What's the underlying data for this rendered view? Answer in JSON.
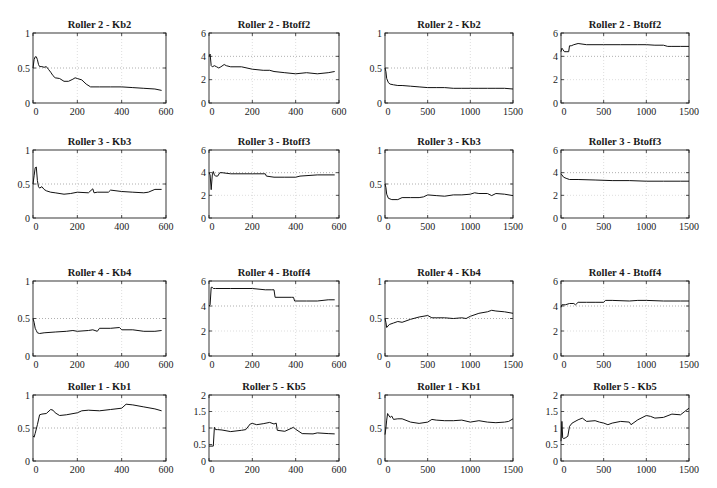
{
  "figure": {
    "layout": {
      "rows": 4,
      "cols": 4
    }
  },
  "chart_data": [
    {
      "id": "r2-kb2-600",
      "type": "line",
      "title": "Roller 2 - Kb2",
      "xlabel": "",
      "ylabel": "",
      "xlim": [
        0,
        600
      ],
      "ylim": [
        0,
        1
      ],
      "xticks": [
        "0",
        "200",
        "400",
        "600"
      ],
      "yticks": [
        "0",
        "0.5",
        "1"
      ],
      "ytick_values": [
        0,
        0.5,
        1
      ],
      "xtick_values": [
        0,
        200,
        400,
        600
      ],
      "grid": true,
      "refline": 0.5,
      "x": [
        0,
        5,
        10,
        15,
        20,
        25,
        30,
        40,
        50,
        60,
        70,
        80,
        90,
        100,
        120,
        140,
        160,
        180,
        190,
        200,
        220,
        240,
        260,
        300,
        350,
        400,
        450,
        500,
        550,
        580
      ],
      "values": [
        0.5,
        0.62,
        0.66,
        0.66,
        0.62,
        0.55,
        0.52,
        0.52,
        0.51,
        0.52,
        0.48,
        0.44,
        0.39,
        0.36,
        0.35,
        0.31,
        0.31,
        0.34,
        0.36,
        0.35,
        0.33,
        0.27,
        0.23,
        0.23,
        0.23,
        0.23,
        0.22,
        0.21,
        0.2,
        0.18
      ]
    },
    {
      "id": "r2-btoff2-600",
      "type": "line",
      "title": "Roller 2 - Btoff2",
      "xlabel": "",
      "ylabel": "",
      "xlim": [
        0,
        600
      ],
      "ylim": [
        0,
        6
      ],
      "xticks": [
        "0",
        "200",
        "400",
        "600"
      ],
      "yticks": [
        "0",
        "2",
        "4",
        "6"
      ],
      "ytick_values": [
        0,
        2,
        4,
        6
      ],
      "xtick_values": [
        0,
        200,
        400,
        600
      ],
      "grid": true,
      "refline": 4,
      "x": [
        0,
        5,
        10,
        15,
        25,
        35,
        45,
        55,
        70,
        80,
        100,
        150,
        200,
        250,
        280,
        300,
        350,
        400,
        450,
        500,
        550,
        580
      ],
      "values": [
        4.0,
        4.2,
        3.2,
        3.1,
        3.2,
        3.1,
        3.0,
        3.1,
        3.3,
        3.2,
        3.1,
        3.1,
        2.9,
        2.8,
        2.8,
        2.7,
        2.6,
        2.5,
        2.6,
        2.5,
        2.6,
        2.7
      ]
    },
    {
      "id": "r2-kb2-1500",
      "type": "line",
      "title": "Roller 2 - Kb2",
      "xlabel": "",
      "ylabel": "",
      "xlim": [
        0,
        1500
      ],
      "ylim": [
        0,
        1
      ],
      "xticks": [
        "0",
        "500",
        "1000",
        "1500"
      ],
      "yticks": [
        "0",
        "0.5",
        "1"
      ],
      "ytick_values": [
        0,
        0.5,
        1
      ],
      "xtick_values": [
        0,
        500,
        1000,
        1500
      ],
      "grid": true,
      "refline": 0.5,
      "x": [
        0,
        10,
        20,
        40,
        60,
        100,
        150,
        200,
        300,
        400,
        500,
        600,
        700,
        800,
        900,
        1000,
        1100,
        1200,
        1300,
        1400,
        1500
      ],
      "values": [
        0.5,
        0.45,
        0.35,
        0.29,
        0.27,
        0.26,
        0.25,
        0.25,
        0.24,
        0.23,
        0.22,
        0.22,
        0.22,
        0.21,
        0.21,
        0.21,
        0.21,
        0.21,
        0.21,
        0.21,
        0.2
      ]
    },
    {
      "id": "r2-btoff2-1500",
      "type": "line",
      "title": "Roller 2 - Btoff2",
      "xlabel": "",
      "ylabel": "",
      "xlim": [
        0,
        1500
      ],
      "ylim": [
        0,
        6
      ],
      "xticks": [
        "0",
        "500",
        "1000",
        "1500"
      ],
      "yticks": [
        "0",
        "2",
        "4",
        "6"
      ],
      "ytick_values": [
        0,
        2,
        4,
        6
      ],
      "xtick_values": [
        0,
        500,
        1000,
        1500
      ],
      "grid": true,
      "refline": 4,
      "x": [
        0,
        10,
        20,
        40,
        60,
        90,
        100,
        120,
        150,
        200,
        300,
        500,
        700,
        900,
        1000,
        1100,
        1200,
        1250,
        1300,
        1400,
        1500
      ],
      "values": [
        4.4,
        4.7,
        4.6,
        4.4,
        4.4,
        4.4,
        4.9,
        4.9,
        5.0,
        5.1,
        5.0,
        5.0,
        5.0,
        5.0,
        5.0,
        4.95,
        4.95,
        4.85,
        4.85,
        4.85,
        4.85
      ]
    },
    {
      "id": "r3-kb3-600",
      "type": "line",
      "title": "Roller 3 - Kb3",
      "xlabel": "",
      "ylabel": "",
      "xlim": [
        0,
        600
      ],
      "ylim": [
        0,
        1
      ],
      "xticks": [
        "0",
        "200",
        "400",
        "600"
      ],
      "yticks": [
        "0",
        "0.5",
        "1"
      ],
      "ytick_values": [
        0,
        0.5,
        1
      ],
      "xtick_values": [
        0,
        200,
        400,
        600
      ],
      "grid": true,
      "refline": 0.5,
      "x": [
        0,
        5,
        10,
        15,
        20,
        25,
        30,
        40,
        50,
        60,
        80,
        100,
        140,
        170,
        200,
        250,
        270,
        275,
        290,
        340,
        350,
        400,
        450,
        500,
        520,
        550,
        580
      ],
      "values": [
        0.5,
        0.62,
        0.74,
        0.75,
        0.55,
        0.46,
        0.44,
        0.46,
        0.42,
        0.4,
        0.38,
        0.37,
        0.35,
        0.36,
        0.38,
        0.37,
        0.43,
        0.37,
        0.38,
        0.38,
        0.41,
        0.39,
        0.38,
        0.37,
        0.38,
        0.42,
        0.42
      ]
    },
    {
      "id": "r3-btoff3-600",
      "type": "line",
      "title": "Roller 3 - Btoff3",
      "xlabel": "",
      "ylabel": "",
      "xlim": [
        0,
        600
      ],
      "ylim": [
        0,
        6
      ],
      "xticks": [
        "0",
        "200",
        "400",
        "600"
      ],
      "yticks": [
        "0",
        "2",
        "4",
        "6"
      ],
      "ytick_values": [
        0,
        2,
        4,
        6
      ],
      "xtick_values": [
        0,
        200,
        400,
        600
      ],
      "grid": true,
      "refline": 4,
      "x": [
        0,
        5,
        10,
        12,
        15,
        20,
        25,
        30,
        40,
        50,
        60,
        100,
        200,
        260,
        265,
        300,
        350,
        400,
        420,
        500,
        580
      ],
      "values": [
        4.0,
        3.8,
        2.5,
        3.0,
        3.8,
        4.1,
        3.8,
        3.7,
        3.7,
        4.0,
        4.0,
        3.9,
        3.9,
        3.9,
        3.7,
        3.6,
        3.6,
        3.6,
        3.7,
        3.8,
        3.8
      ]
    },
    {
      "id": "r3-kb3-1500",
      "type": "line",
      "title": "Roller 3 - Kb3",
      "xlabel": "",
      "ylabel": "",
      "xlim": [
        0,
        1500
      ],
      "ylim": [
        0,
        1
      ],
      "xticks": [
        "0",
        "500",
        "1000",
        "1500"
      ],
      "yticks": [
        "0",
        "0.5",
        "1"
      ],
      "ytick_values": [
        0,
        0.5,
        1
      ],
      "xtick_values": [
        0,
        500,
        1000,
        1500
      ],
      "grid": true,
      "refline": 0.5,
      "x": [
        0,
        10,
        20,
        40,
        80,
        150,
        200,
        300,
        400,
        450,
        500,
        600,
        700,
        800,
        900,
        1000,
        1050,
        1100,
        1200,
        1250,
        1300,
        1400,
        1500
      ],
      "values": [
        0.5,
        0.45,
        0.35,
        0.29,
        0.27,
        0.27,
        0.3,
        0.3,
        0.3,
        0.31,
        0.34,
        0.33,
        0.32,
        0.34,
        0.34,
        0.35,
        0.37,
        0.36,
        0.36,
        0.33,
        0.36,
        0.35,
        0.33
      ]
    },
    {
      "id": "r3-btoff3-1500",
      "type": "line",
      "title": "Roller 3 - Btoff3",
      "xlabel": "",
      "ylabel": "",
      "xlim": [
        0,
        1500
      ],
      "ylim": [
        0,
        6
      ],
      "xticks": [
        "0",
        "500",
        "1000",
        "1500"
      ],
      "yticks": [
        "0",
        "2",
        "4",
        "6"
      ],
      "ytick_values": [
        0,
        2,
        4,
        6
      ],
      "xtick_values": [
        0,
        500,
        1000,
        1500
      ],
      "grid": true,
      "refline": 4,
      "x": [
        0,
        10,
        30,
        60,
        100,
        200,
        400,
        600,
        800,
        1000,
        1200,
        1400,
        1500
      ],
      "values": [
        3.9,
        3.8,
        3.6,
        3.5,
        3.4,
        3.4,
        3.35,
        3.3,
        3.3,
        3.25,
        3.25,
        3.25,
        3.25
      ]
    },
    {
      "id": "r4-kb4-600",
      "type": "line",
      "title": "Roller 4 - Kb4",
      "xlabel": "",
      "ylabel": "",
      "xlim": [
        0,
        600
      ],
      "ylim": [
        0,
        1
      ],
      "xticks": [
        "0",
        "200",
        "400",
        "600"
      ],
      "yticks": [
        "0",
        "0.5",
        "1"
      ],
      "ytick_values": [
        0,
        0.5,
        1
      ],
      "xtick_values": [
        0,
        200,
        400,
        600
      ],
      "grid": true,
      "refline": 0.5,
      "x": [
        0,
        5,
        10,
        15,
        20,
        30,
        50,
        100,
        150,
        180,
        200,
        250,
        270,
        290,
        300,
        350,
        390,
        400,
        450,
        500,
        550,
        580
      ],
      "values": [
        0.5,
        0.45,
        0.37,
        0.34,
        0.31,
        0.3,
        0.31,
        0.32,
        0.33,
        0.34,
        0.33,
        0.34,
        0.35,
        0.33,
        0.37,
        0.37,
        0.38,
        0.35,
        0.35,
        0.33,
        0.33,
        0.34
      ]
    },
    {
      "id": "r4-btoff4-600",
      "type": "line",
      "title": "Roller 4 - Btoff4",
      "xlabel": "",
      "ylabel": "",
      "xlim": [
        0,
        600
      ],
      "ylim": [
        0,
        6
      ],
      "xticks": [
        "0",
        "200",
        "400",
        "600"
      ],
      "yticks": [
        "0",
        "2",
        "4",
        "6"
      ],
      "ytick_values": [
        0,
        2,
        4,
        6
      ],
      "xtick_values": [
        0,
        200,
        400,
        600
      ],
      "grid": true,
      "refline": 4,
      "x": [
        0,
        5,
        10,
        15,
        20,
        30,
        100,
        200,
        260,
        290,
        300,
        305,
        380,
        390,
        395,
        450,
        500,
        550,
        580
      ],
      "values": [
        4.0,
        4.1,
        5.5,
        5.5,
        5.4,
        5.4,
        5.4,
        5.4,
        5.3,
        5.3,
        5.3,
        4.7,
        4.7,
        4.7,
        4.4,
        4.4,
        4.4,
        4.5,
        4.5
      ]
    },
    {
      "id": "r4-kb4-1500",
      "type": "line",
      "title": "Roller 4 - Kb4",
      "xlabel": "",
      "ylabel": "",
      "xlim": [
        0,
        1500
      ],
      "ylim": [
        0,
        1
      ],
      "xticks": [
        "0",
        "500",
        "1000",
        "1500"
      ],
      "yticks": [
        "0",
        "0.5",
        "1"
      ],
      "ytick_values": [
        0,
        0.5,
        1
      ],
      "xtick_values": [
        0,
        500,
        1000,
        1500
      ],
      "grid": true,
      "refline": 0.5,
      "x": [
        0,
        10,
        20,
        50,
        100,
        150,
        200,
        300,
        400,
        500,
        550,
        600,
        700,
        800,
        900,
        950,
        1000,
        1100,
        1200,
        1250,
        1300,
        1400,
        1500
      ],
      "values": [
        0.5,
        0.45,
        0.38,
        0.42,
        0.44,
        0.46,
        0.45,
        0.49,
        0.52,
        0.54,
        0.51,
        0.51,
        0.51,
        0.5,
        0.51,
        0.5,
        0.53,
        0.57,
        0.59,
        0.61,
        0.6,
        0.59,
        0.57
      ]
    },
    {
      "id": "r4-btoff4-1500",
      "type": "line",
      "title": "Roller 4 - Btoff4",
      "xlabel": "",
      "ylabel": "",
      "xlim": [
        0,
        1500
      ],
      "ylim": [
        0,
        6
      ],
      "xticks": [
        "0",
        "500",
        "1000",
        "1500"
      ],
      "yticks": [
        "0",
        "2",
        "4",
        "6"
      ],
      "ytick_values": [
        0,
        2,
        4,
        6
      ],
      "xtick_values": [
        0,
        500,
        1000,
        1500
      ],
      "grid": true,
      "refline": 4,
      "x": [
        0,
        10,
        50,
        100,
        150,
        170,
        200,
        300,
        400,
        500,
        520,
        600,
        800,
        900,
        1000,
        1200,
        1400,
        1500
      ],
      "values": [
        3.9,
        4.1,
        4.1,
        4.2,
        4.2,
        4.1,
        4.3,
        4.3,
        4.3,
        4.3,
        4.45,
        4.45,
        4.4,
        4.45,
        4.45,
        4.4,
        4.4,
        4.4
      ]
    },
    {
      "id": "r1-kb1-600",
      "type": "line",
      "title": "Roller 1 - Kb1",
      "xlabel": "",
      "ylabel": "",
      "xlim": [
        0,
        600
      ],
      "ylim": [
        0,
        1
      ],
      "xticks": [
        "0",
        "200",
        "400",
        "600"
      ],
      "yticks": [
        "0",
        "0.5",
        "1"
      ],
      "ytick_values": [
        0,
        0.5,
        1
      ],
      "xtick_values": [
        0,
        200,
        400,
        600
      ],
      "grid": true,
      "refline": 0.5,
      "x": [
        0,
        5,
        10,
        20,
        30,
        40,
        60,
        80,
        90,
        100,
        120,
        150,
        200,
        220,
        250,
        300,
        350,
        400,
        420,
        450,
        500,
        550,
        580
      ],
      "values": [
        0.38,
        0.36,
        0.42,
        0.55,
        0.7,
        0.71,
        0.72,
        0.78,
        0.77,
        0.73,
        0.69,
        0.7,
        0.73,
        0.76,
        0.77,
        0.76,
        0.78,
        0.8,
        0.86,
        0.85,
        0.82,
        0.79,
        0.76
      ]
    },
    {
      "id": "r5-kb5-600",
      "type": "line",
      "title": "Roller 5 - Kb5",
      "xlabel": "",
      "ylabel": "",
      "xlim": [
        0,
        600
      ],
      "ylim": [
        0,
        2
      ],
      "xticks": [
        "0",
        "200",
        "400",
        "600"
      ],
      "yticks": [
        "0",
        "0.5",
        "1",
        "1.5",
        "2"
      ],
      "ytick_values": [
        0,
        0.5,
        1,
        1.5,
        2
      ],
      "xtick_values": [
        0,
        200,
        400,
        600
      ],
      "grid": true,
      "refline": 1,
      "x": [
        0,
        20,
        25,
        30,
        40,
        60,
        100,
        150,
        170,
        190,
        200,
        220,
        250,
        280,
        300,
        310,
        315,
        350,
        390,
        400,
        430,
        480,
        500,
        550,
        580
      ],
      "values": [
        0.45,
        0.45,
        1.02,
        0.95,
        0.95,
        0.94,
        0.89,
        0.93,
        0.95,
        1.12,
        1.14,
        1.1,
        1.13,
        1.17,
        1.12,
        1.15,
        0.93,
        0.9,
        1.02,
        0.96,
        0.83,
        0.82,
        0.85,
        0.83,
        0.82
      ]
    },
    {
      "id": "r1-kb1-1500",
      "type": "line",
      "title": "Roller 1 - Kb1",
      "xlabel": "",
      "ylabel": "",
      "xlim": [
        0,
        1500
      ],
      "ylim": [
        0,
        1
      ],
      "xticks": [
        "0",
        "500",
        "1000",
        "1500"
      ],
      "yticks": [
        "0",
        "0.5",
        "1"
      ],
      "ytick_values": [
        0,
        0.5,
        1
      ],
      "xtick_values": [
        0,
        500,
        1000,
        1500
      ],
      "grid": true,
      "refline": 0.5,
      "x": [
        0,
        10,
        20,
        30,
        40,
        60,
        80,
        100,
        150,
        200,
        300,
        400,
        500,
        550,
        600,
        700,
        800,
        900,
        1000,
        1100,
        1200,
        1300,
        1400,
        1450,
        1500
      ],
      "values": [
        0.4,
        0.5,
        0.62,
        0.72,
        0.7,
        0.66,
        0.68,
        0.63,
        0.64,
        0.64,
        0.59,
        0.57,
        0.59,
        0.63,
        0.62,
        0.61,
        0.61,
        0.62,
        0.59,
        0.61,
        0.59,
        0.58,
        0.59,
        0.6,
        0.64
      ]
    },
    {
      "id": "r5-kb5-1500",
      "type": "line",
      "title": "Roller 5 - Kb5",
      "xlabel": "",
      "ylabel": "",
      "xlim": [
        0,
        1500
      ],
      "ylim": [
        0,
        2
      ],
      "xticks": [
        "0",
        "500",
        "1000",
        "1500"
      ],
      "yticks": [
        "0",
        "0.5",
        "1",
        "1.5",
        "2"
      ],
      "ytick_values": [
        0,
        0.5,
        1,
        1.5,
        2
      ],
      "xtick_values": [
        0,
        500,
        1000,
        1500
      ],
      "grid": true,
      "refline": 1,
      "x": [
        0,
        10,
        20,
        30,
        50,
        80,
        100,
        130,
        200,
        250,
        300,
        400,
        450,
        500,
        550,
        600,
        700,
        800,
        820,
        900,
        1000,
        1050,
        1100,
        1200,
        1300,
        1400,
        1450,
        1500
      ],
      "values": [
        0.6,
        1.2,
        0.7,
        0.68,
        0.7,
        0.75,
        1.05,
        1.15,
        1.25,
        1.3,
        1.2,
        1.22,
        1.18,
        1.15,
        1.1,
        1.15,
        1.2,
        1.18,
        1.1,
        1.25,
        1.38,
        1.35,
        1.3,
        1.32,
        1.42,
        1.4,
        1.5,
        1.6
      ]
    }
  ]
}
